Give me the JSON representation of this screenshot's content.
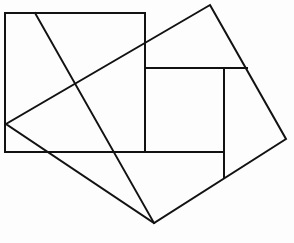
{
  "figure": {
    "canvas": {
      "width": 294,
      "height": 243,
      "background_color": "#fdfdfd"
    },
    "style": {
      "stroke_color": "#121212",
      "stroke_width": 2,
      "fill": "none"
    },
    "shapes": [
      {
        "name": "axis-aligned-rectangle",
        "type": "polygon",
        "closed": true,
        "points": [
          [
            5,
            13
          ],
          [
            145,
            13
          ],
          [
            145,
            152
          ],
          [
            5,
            152
          ]
        ]
      },
      {
        "name": "tilted-square",
        "type": "polygon",
        "closed": true,
        "points": [
          [
            210,
            5
          ],
          [
            286,
            139
          ],
          [
            154,
            223
          ],
          [
            6,
            124
          ]
        ]
      },
      {
        "name": "upper-inner-horizontal-line",
        "type": "polyline",
        "closed": false,
        "points": [
          [
            145,
            68
          ],
          [
            247,
            68
          ]
        ]
      },
      {
        "name": "inner-vertical-line",
        "type": "polyline",
        "closed": false,
        "points": [
          [
            224,
            68
          ],
          [
            224,
            177
          ]
        ]
      },
      {
        "name": "lower-inner-horizontal-line",
        "type": "polyline",
        "closed": false,
        "points": [
          [
            145,
            152
          ],
          [
            224,
            152
          ]
        ]
      },
      {
        "name": "crossing-diagonal-line",
        "type": "polyline",
        "closed": false,
        "points": [
          [
            35,
            13
          ],
          [
            154,
            223
          ]
        ]
      }
    ]
  }
}
